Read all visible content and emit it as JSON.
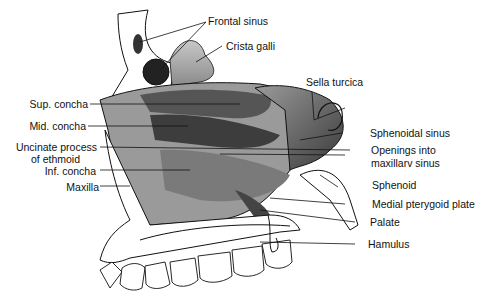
{
  "labels": {
    "frontal_sinus": "Frontal sinus",
    "crista_galli": "Crista galli",
    "sella_turcica": "Sella turcica",
    "sup_concha": "Sup. concha",
    "mid_concha": "Mid. concha",
    "uncinate_1": "Uncinate process",
    "uncinate_2": "of ethmoid",
    "inf_concha": "Inf. concha",
    "maxilla": "Maxilla",
    "sphenoidal_sinus": "Sphenoidal sinus",
    "openings_1": "Openings into",
    "openings_2": "maxillarv sinus",
    "sphenoid": "Sphenoid",
    "medial_pterygoid": "Medial pterygoid plate",
    "palate": "Palate",
    "hamulus": "Hamulus"
  },
  "colors": {
    "ink": "#111111",
    "shade_dark": "#2a2a2a",
    "shade_mid": "#7a7a7a",
    "shade_light": "#b8b8b8",
    "paper": "#ffffff"
  }
}
